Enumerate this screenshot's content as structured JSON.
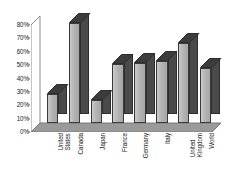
{
  "chart_data": {
    "type": "bar",
    "title": "",
    "subtitle": "",
    "xlabel": "",
    "ylabel": "",
    "categories": [
      "United States",
      "Canada",
      "Japan",
      "France",
      "Germany",
      "Italy",
      "United Kingdom",
      "World"
    ],
    "category_lines": [
      [
        "United",
        "States"
      ],
      [
        "Canada"
      ],
      [
        "Japan"
      ],
      [
        "France"
      ],
      [
        "Germany"
      ],
      [
        "Italy"
      ],
      [
        "United",
        "Kingdom"
      ],
      [
        "World"
      ]
    ],
    "values": [
      22,
      75,
      17,
      44,
      45,
      46,
      60,
      41
    ],
    "value_unit": "%",
    "ylim": [
      0,
      80
    ],
    "ytick_step": 10,
    "ytick_labels": [
      "80%",
      "70%",
      "60%",
      "50%",
      "40%",
      "30%",
      "20%",
      "10%",
      "0%"
    ],
    "ytick_values": [
      80,
      70,
      60,
      50,
      40,
      30,
      20,
      10,
      0
    ],
    "grid": false,
    "legend": null,
    "legend_position": "none",
    "style": "3d-column",
    "colors": {
      "bar_front": "#b4b4b4",
      "bar_side": "#4a4a4a",
      "bar_top": "#3c3c3c",
      "bar_outline": "#3a3a3a",
      "axis": "#8c8c8c",
      "floor": "#9a9a9a",
      "text": "#1b1b1b",
      "background": "#ffffff"
    }
  }
}
